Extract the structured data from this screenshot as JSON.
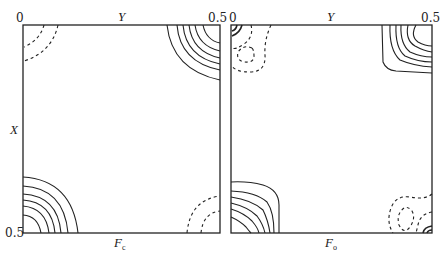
{
  "figure": {
    "panels": [
      {
        "id": "calculated",
        "title_symbol": "F",
        "title_subscript": "c",
        "top_axis_label": "Y",
        "left_axis_label": "X",
        "top_left_tick": "0",
        "top_right_tick": "0.5",
        "bottom_left_tick": "0.5",
        "contour_styles": {
          "positive": "solid",
          "negative": "dashed"
        }
      },
      {
        "id": "observed",
        "title_symbol": "F",
        "title_subscript": "o",
        "top_axis_label": "Y",
        "top_left_tick": "0",
        "top_right_tick": "0.5",
        "contour_styles": {
          "positive": "solid",
          "negative": "dashed"
        }
      }
    ],
    "line_color": "#222222",
    "background": "#ffffff"
  }
}
